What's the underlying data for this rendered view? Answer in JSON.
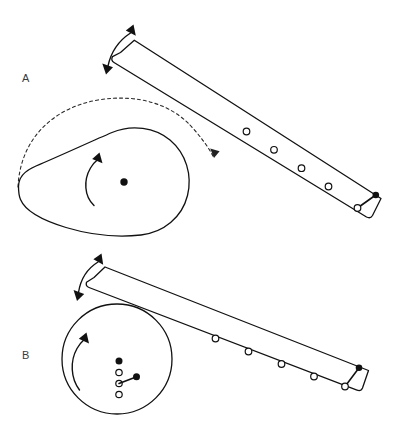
{
  "figure": {
    "background_color": "#ffffff",
    "line_color": "#111111",
    "width": 411,
    "height": 440,
    "panels": [
      {
        "id": "A",
        "label": "A",
        "label_x": 22,
        "label_y": 82,
        "description": "Teardrop cam rotating counter-clockwise drives a slotted lever with four holes; dashed arc shows the follower path.",
        "rotor": {
          "type": "teardrop-cam",
          "center_x": 124,
          "center_y": 182,
          "hub_radius": 3.6,
          "rotation_arrow": "counter-clockwise"
        },
        "lever": {
          "holes": 4,
          "pivot_arrow": "double-headed",
          "end_connector": {
            "pin": "open-circle",
            "ball": "filled-dot"
          }
        }
      },
      {
        "id": "B",
        "label": "B",
        "label_x": 22,
        "label_y": 359,
        "description": "Circular disc rotating counter-clockwise with a column of pivot holes and a connecting rod driving the slotted lever.",
        "rotor": {
          "type": "circular-disc",
          "center_x": 117,
          "center_y": 359,
          "radius": 55,
          "rotation_arrow": "counter-clockwise"
        },
        "lever": {
          "holes": 4,
          "pivot_arrow": "double-headed",
          "end_connector": {
            "pin": "open-circle",
            "ball": "filled-dot"
          }
        },
        "disc_pins": [
          {
            "kind": "filled-dot",
            "x": 119,
            "y": 361
          },
          {
            "kind": "open-circle",
            "x": 119,
            "y": 372
          },
          {
            "kind": "open-circle",
            "x": 119,
            "y": 383
          },
          {
            "kind": "open-circle",
            "x": 119,
            "y": 394
          },
          {
            "kind": "filled-dot",
            "x": 136,
            "y": 377
          }
        ]
      }
    ],
    "annotations": {
      "panel_a_trajectory": "dashed arc over cam",
      "panel_a_arrow_down": "dashed arrow pointing down-right",
      "rotation_label": "counter-clockwise"
    }
  }
}
